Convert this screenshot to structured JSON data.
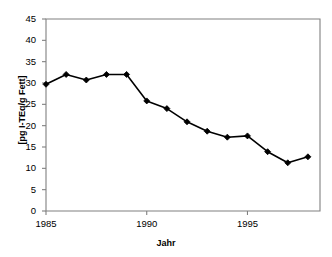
{
  "chart_data": {
    "type": "line",
    "title": "",
    "xlabel": "Jahr",
    "ylabel": "[pg I-TEq/g Fett]",
    "x": [
      1985,
      1986,
      1987,
      1988,
      1989,
      1990,
      1991,
      1992,
      1993,
      1994,
      1995,
      1996,
      1997,
      1998
    ],
    "values": [
      29.7,
      32.0,
      30.7,
      32.0,
      32.0,
      25.8,
      24.0,
      20.9,
      18.7,
      17.3,
      17.6,
      13.9,
      11.3,
      12.7
    ],
    "xlim": [
      1985,
      1998.6
    ],
    "ylim": [
      0,
      45
    ],
    "ytick_labels": [
      "0",
      "5",
      "10",
      "15",
      "20",
      "25",
      "30",
      "35",
      "40",
      "45"
    ],
    "ytick_values": [
      0,
      5,
      10,
      15,
      20,
      25,
      30,
      35,
      40,
      45
    ],
    "xtick_labels": [
      "1985",
      "1990",
      "1995"
    ],
    "xtick_values": [
      1985,
      1990,
      1995
    ],
    "grid": false,
    "legend": null,
    "marker": "diamond",
    "marker_color": "#000000",
    "line_color": "#000000",
    "plot_background": "#ffffff",
    "axis_color": "#808080"
  },
  "axes": {
    "y_title": "[pg I-TEq/g Fett]",
    "x_title": "Jahr"
  }
}
